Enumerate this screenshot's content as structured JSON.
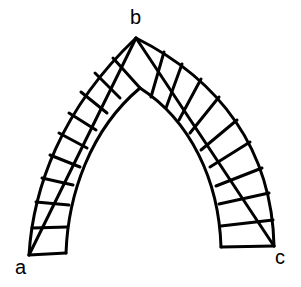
{
  "diagram": {
    "type": "pointed-arch",
    "colors": {
      "line": "#000000",
      "background": "#ffffff"
    },
    "labels": {
      "a": "a",
      "b": "b",
      "c": "c"
    },
    "points": {
      "b": [
        136,
        38
      ],
      "a": [
        29,
        255
      ],
      "c": [
        274,
        246
      ]
    },
    "left_voussoir_count": 9,
    "right_voussoir_count": 9
  }
}
